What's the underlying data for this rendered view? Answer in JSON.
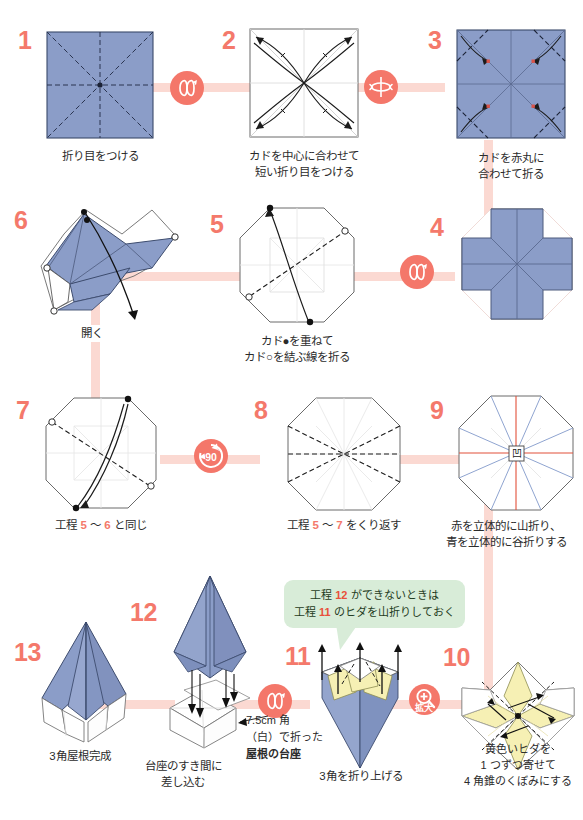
{
  "document": {
    "kind": "origami-instruction-diagram",
    "title": "3角屋根の折り方",
    "accent_color": "#f4796b",
    "paper_color": "#8b9dc8",
    "flow_color": "#fbd9d2",
    "callout_color": "#d8ecd8",
    "inner_color": "#f6f0b4"
  },
  "steps": [
    {
      "number": "1",
      "caption_lines": [
        "折り目をつける"
      ]
    },
    {
      "number": "2",
      "caption_lines": [
        "カドを中心に合わせて",
        "短い折り目をつける"
      ]
    },
    {
      "number": "3",
      "caption_lines": [
        "カドを赤丸に",
        "合わせて折る"
      ]
    },
    {
      "number": "4",
      "caption_lines": []
    },
    {
      "number": "5",
      "caption_lines": [
        "カド●を重ねて",
        "カド○を結ぶ線を折る"
      ]
    },
    {
      "number": "6",
      "caption_lines": [
        "開く"
      ]
    },
    {
      "number": "7",
      "caption_lines": [
        "工程 5 〜 6 と同じ"
      ],
      "caption_html": "工程 <span class=\"hl\">5</span> 〜 <span class=\"hl\">6</span> と同じ"
    },
    {
      "number": "8",
      "caption_lines": [
        "工程 5 〜 7 をくり返す"
      ],
      "caption_html": "工程 <span class=\"hl\">5</span> 〜 <span class=\"hl\">7</span> をくり返す"
    },
    {
      "number": "9",
      "caption_lines": [
        "赤を立体的に山折り、",
        "青を立体的に谷折りする"
      ]
    },
    {
      "number": "10",
      "caption_lines": [
        "黄色いヒダを",
        "1 つずつ寄せて",
        "4 角錐のくぼみにする"
      ]
    },
    {
      "number": "11",
      "caption_lines": [
        "3角を折り上げる"
      ]
    },
    {
      "number": "12",
      "caption_lines": [
        "台座のすき間に",
        "差し込む"
      ]
    },
    {
      "number": "13",
      "caption_lines": [
        "3角屋根完成"
      ]
    }
  ],
  "annotations": {
    "base_note_lines": [
      "7.5cm 角",
      "（白）で折った",
      "屋根の台座"
    ],
    "base_note_bold_line": "屋根の台座",
    "callout_line1": "工程 12 ができないときは",
    "callout_line2": "工程 11 のヒダを山折りしておく",
    "callout_hl1": "12",
    "callout_hl2": "11",
    "step9_center_mark": "凹"
  },
  "badges": [
    {
      "id": "turn-1-2",
      "glyph": "turn-over-arrows",
      "label": ""
    },
    {
      "id": "flip-2-3",
      "glyph": "flip-vertical",
      "label": ""
    },
    {
      "id": "turn-4-5",
      "glyph": "turn-over-arrows",
      "label": ""
    },
    {
      "id": "rotate-7-8",
      "glyph": "rotate-90",
      "label": "90"
    },
    {
      "id": "zoom-9-10",
      "glyph": "magnifier-plus",
      "label": "拡大"
    },
    {
      "id": "zoom-10-11",
      "glyph": "magnifier-plus",
      "label": "拡大"
    },
    {
      "id": "turn-11-12",
      "glyph": "turn-over-arrows",
      "label": ""
    }
  ]
}
